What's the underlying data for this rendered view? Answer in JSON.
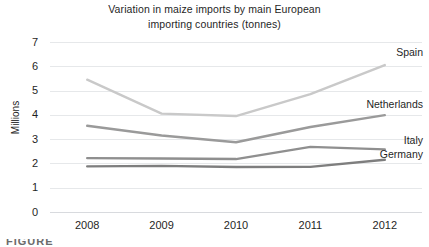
{
  "chart_data": {
    "type": "line",
    "title": "Variation in maize imports by main European importing countries (tonnes)",
    "title_lines": [
      "Variation in maize imports by main European",
      "importing countries (tonnes)"
    ],
    "xlabel": "",
    "ylabel": "Millions",
    "categories": [
      "2008",
      "2009",
      "2010",
      "2011",
      "2012"
    ],
    "x": [
      2008,
      2009,
      2010,
      2011,
      2012
    ],
    "ylim": [
      0,
      7
    ],
    "yticks": [
      "7",
      "6",
      "5",
      "4",
      "3",
      "2",
      "1",
      "0"
    ],
    "ytick_values": [
      7,
      6,
      5,
      4,
      3,
      2,
      1,
      0
    ],
    "grid": true,
    "legend_position": "inline-right",
    "series": [
      {
        "name": "Spain",
        "values": [
          5.45,
          4.05,
          3.95,
          4.85,
          6.05
        ],
        "color": "#c9c9c9",
        "label_y": 6.6
      },
      {
        "name": "Netherlands",
        "values": [
          3.55,
          3.15,
          2.87,
          3.5,
          3.99
        ],
        "color": "#9a9a9a",
        "label_y": 4.45
      },
      {
        "name": "Italy",
        "values": [
          2.22,
          2.2,
          2.18,
          2.68,
          2.58
        ],
        "color": "#8f8f8f",
        "label_y": 2.95
      },
      {
        "name": "Germany",
        "values": [
          1.88,
          1.9,
          1.85,
          1.86,
          2.15
        ],
        "color": "#7e7e7e",
        "label_y": 2.38
      }
    ]
  },
  "caption": {
    "fragment": "FIGURE"
  }
}
